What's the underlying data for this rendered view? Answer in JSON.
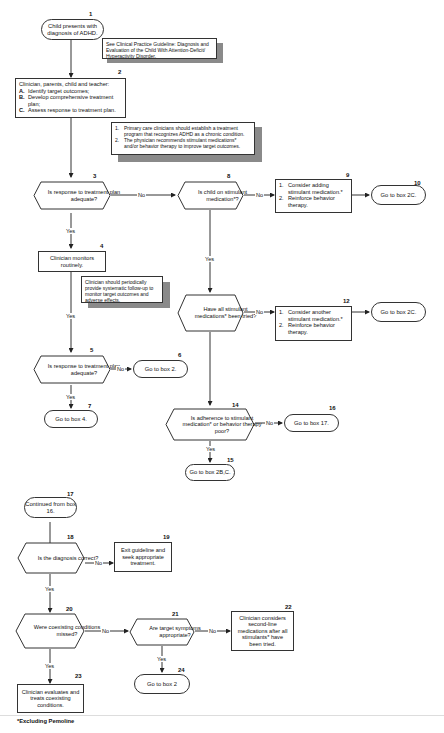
{
  "footnote": "*Excluding Pemoline",
  "nodes": {
    "n1": {
      "num": "1",
      "text": "Child presents with diagnosis of ADHD."
    },
    "n1_note": {
      "text": "See Clinical Practice Guideline: Diagnosis and Evaluation of the Child With Attention-Deficit/ Hyperactivity Disorder."
    },
    "n2": {
      "num": "2",
      "title": "Clinician, parents, child and teacher:",
      "items": [
        {
          "key": "A.",
          "text": "Identify target outcomes;"
        },
        {
          "key": "B.",
          "text": "Develop comprehensive treatment plan;"
        },
        {
          "key": "C.",
          "text": "Assess response to treatment plan."
        }
      ]
    },
    "n2_note": {
      "items": [
        {
          "key": "1.",
          "text": "Primary care clinicians should establish a treatment program that recognizes ADHD as a chronic condition."
        },
        {
          "key": "2.",
          "text": "The physician recommends stimulant medications* and/or behavior therapy to improve target outcomes."
        }
      ]
    },
    "n3": {
      "num": "3",
      "text": "Is response to treatment plan adequate?"
    },
    "n4": {
      "num": "4",
      "text": "Clinician monitors routinely."
    },
    "n4_note": {
      "text": "Clinician should periodically provide systematic follow-up to monitor target outcomes and adverse effects."
    },
    "n5": {
      "num": "5",
      "text": "Is response to treatment plan adequate?"
    },
    "n6": {
      "num": "6",
      "text": "Go to box 2."
    },
    "n7": {
      "num": "7",
      "text": "Go to box 4."
    },
    "n8": {
      "num": "8",
      "text": "Is child on stimulant medication*?"
    },
    "n9": {
      "num": "9",
      "items": [
        {
          "key": "1.",
          "text": "Consider adding stimulant medication.*"
        },
        {
          "key": "2.",
          "text": "Reinforce behavior therapy."
        }
      ]
    },
    "n10": {
      "num": "10",
      "text": "Go to box 2C."
    },
    "n11": {
      "num": "11",
      "text": "Have all stimulant medications* been tried?"
    },
    "n12": {
      "num": "12",
      "items": [
        {
          "key": "1.",
          "text": "Consider another stimulant medication.*"
        },
        {
          "key": "2.",
          "text": "Reinforce behavior therapy."
        }
      ]
    },
    "n13": {
      "num": "13",
      "text": "Go to box 2C."
    },
    "n14": {
      "num": "14",
      "text": "Is adherence to stimulant medication* or behavior therapy poor?"
    },
    "n15": {
      "num": "15",
      "text": "Go to box 2B,C."
    },
    "n16": {
      "num": "16",
      "text": "Go to box 17."
    },
    "n17": {
      "num": "17",
      "text": "Continued from box 16."
    },
    "n18": {
      "num": "18",
      "text": "Is the diagnosis correct?"
    },
    "n19": {
      "num": "19",
      "text": "Exit guideline and seek appropriate treatment."
    },
    "n20": {
      "num": "20",
      "text": "Were coexisting conditions missed?"
    },
    "n21": {
      "num": "21",
      "text": "Are target symptoms appropriate?"
    },
    "n22": {
      "num": "22",
      "text": "Clinician considers second-line medications after all stimulants* have been tried."
    },
    "n23": {
      "num": "23",
      "text": "Clinician evaluates and treats coexisting conditions."
    },
    "n24": {
      "num": "24",
      "text": "Go to box 2"
    }
  },
  "edges": {
    "yes": "Yes",
    "no": "No"
  }
}
